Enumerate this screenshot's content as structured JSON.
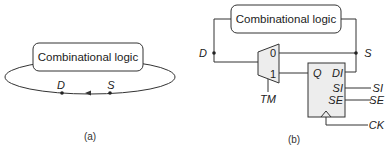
{
  "panel_a": {
    "block_label": "Combinational logic",
    "node_d": "D",
    "node_s": "S",
    "caption": "(a)"
  },
  "panel_b": {
    "block_label": "Combinational logic",
    "node_d": "D",
    "node_s": "S",
    "mux": {
      "in0": "0",
      "in1": "1",
      "select": "TM"
    },
    "flipflop": {
      "out_q": "Q",
      "in_di": "DI",
      "in_si": "SI",
      "in_se": "SE"
    },
    "ext_si": "SI",
    "ext_se": "SE",
    "ext_ck": "CK",
    "caption": "(b)"
  },
  "colors": {
    "stroke": "#333333",
    "fill_component": "#ededed",
    "background": "#ffffff"
  }
}
